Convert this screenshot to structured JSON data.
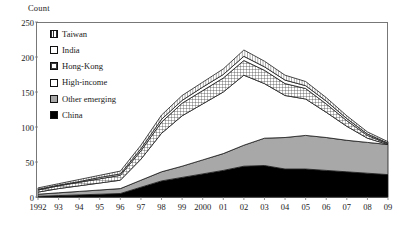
{
  "chart_data": {
    "type": "area",
    "title": "",
    "xlabel": "",
    "ylabel": "Count",
    "ylim": [
      0,
      250
    ],
    "yticks": [
      0,
      50,
      100,
      150,
      200,
      250
    ],
    "grid": false,
    "legend_position": "upper-left-inside",
    "stacked": true,
    "stack_order_bottom_to_top": [
      "China",
      "Other emerging",
      "High-income",
      "Hong-Kong",
      "India",
      "Taiwan"
    ],
    "categories": [
      "1992",
      "93",
      "94",
      "95",
      "96",
      "97",
      "98",
      "99",
      "2000",
      "01",
      "02",
      "03",
      "04",
      "05",
      "06",
      "07",
      "08",
      "09"
    ],
    "series": [
      {
        "name": "China",
        "fill": "black",
        "values": [
          1,
          2,
          3,
          4,
          5,
          14,
          23,
          28,
          33,
          38,
          44,
          45,
          40,
          40,
          38,
          36,
          34,
          32
        ]
      },
      {
        "name": "Other emerging",
        "fill": "gray",
        "values": [
          3,
          4,
          5,
          6,
          7,
          10,
          13,
          16,
          20,
          24,
          30,
          39,
          45,
          48,
          47,
          45,
          44,
          43
        ]
      },
      {
        "name": "High-income",
        "fill": "white",
        "values": [
          3,
          6,
          8,
          10,
          12,
          30,
          55,
          72,
          80,
          88,
          100,
          78,
          60,
          52,
          36,
          20,
          6,
          0
        ]
      },
      {
        "name": "Hong-Kong",
        "fill": "cross-hatch",
        "values": [
          3,
          4,
          5,
          6,
          7,
          12,
          16,
          18,
          19,
          20,
          21,
          19,
          17,
          15,
          12,
          8,
          4,
          1
        ]
      },
      {
        "name": "India",
        "fill": "white",
        "values": [
          1,
          1,
          1,
          2,
          2,
          3,
          4,
          4,
          5,
          5,
          6,
          5,
          5,
          4,
          4,
          3,
          2,
          1
        ]
      },
      {
        "name": "Taiwan",
        "fill": "vertical-hatch",
        "values": [
          2,
          2,
          3,
          3,
          4,
          5,
          6,
          7,
          7,
          8,
          9,
          8,
          7,
          6,
          5,
          4,
          3,
          2
        ]
      }
    ],
    "totals": [
      13,
      19,
      25,
      31,
      37,
      74,
      117,
      145,
      164,
      183,
      210,
      194,
      174,
      165,
      142,
      116,
      93,
      79
    ]
  },
  "legend": {
    "items": [
      {
        "label": "Taiwan",
        "swatch": "vertical-hatch-swatch"
      },
      {
        "label": "India",
        "swatch": "light-cross-swatch"
      },
      {
        "label": "Hong-Kong",
        "swatch": "cross-hatch-swatch"
      },
      {
        "label": "High-income",
        "swatch": "white-swatch"
      },
      {
        "label": "Other emerging",
        "swatch": "gray-swatch"
      },
      {
        "label": "China",
        "swatch": "black-swatch"
      }
    ]
  },
  "axes": {
    "y_axis_title": "Count",
    "y_ticks": [
      "250",
      "200",
      "150",
      "100",
      "50",
      "0"
    ],
    "x_ticks": [
      "1992",
      "93",
      "94",
      "95",
      "96",
      "97",
      "98",
      "99",
      "2000",
      "01",
      "02",
      "03",
      "04",
      "05",
      "06",
      "07",
      "08",
      "09"
    ]
  },
  "colors": {
    "black": "#000000",
    "gray": "#a8a8a8",
    "white": "#ffffff",
    "axis": "#555555",
    "text": "#1a1a1a"
  }
}
